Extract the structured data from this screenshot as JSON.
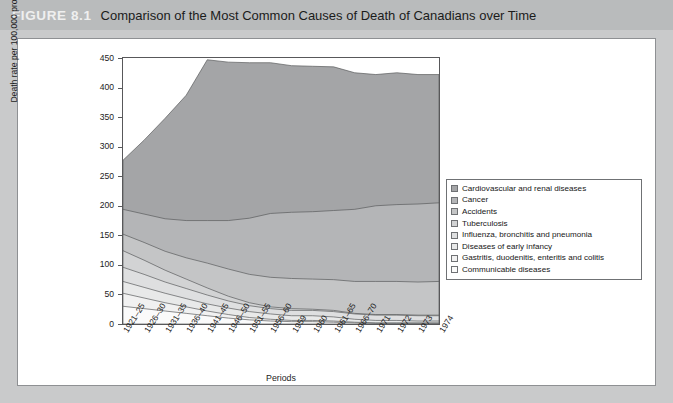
{
  "figure": {
    "number": "FIGURE 8.1",
    "title": "Comparison of the Most Common Causes of Death of Canadians over Time"
  },
  "colors": {
    "banner": "#b9bbbc",
    "page_background": "#c9cacb",
    "card": "#ffffff",
    "frame": "#58585a",
    "series": [
      "#a4a5a7",
      "#b4b5b7",
      "#c4c5c6",
      "#d2d3d4",
      "#dedfe0",
      "#e8e9e9",
      "#f1f1f1",
      "#fafafa"
    ]
  },
  "legend": {
    "items": [
      {
        "label": "Cardiovascular and renal diseases",
        "color": "#a4a5a7"
      },
      {
        "label": "Cancer",
        "color": "#b4b5b7"
      },
      {
        "label": "Accidents",
        "color": "#c4c5c6"
      },
      {
        "label": "Tuberculosis",
        "color": "#d2d3d4"
      },
      {
        "label": "Influenza, bronchitis and pneumonia",
        "color": "#dedfe0"
      },
      {
        "label": "Diseases of early infancy",
        "color": "#e8e9e9"
      },
      {
        "label": "Gastritis, duodenitis, enteritis and colitis",
        "color": "#f1f1f1"
      },
      {
        "label": "Communicable diseases",
        "color": "#fafafa"
      }
    ]
  },
  "chart_data": {
    "type": "area",
    "stacked": true,
    "title": "Comparison of the Most Common Causes of Death of Canadians over Time",
    "xlabel": "Periods",
    "ylabel": "Death rate per 100,000 prop'n by cause",
    "ylim": [
      0,
      450
    ],
    "ytick_step": 50,
    "yticks": [
      0,
      50,
      100,
      150,
      200,
      250,
      300,
      350,
      400,
      450
    ],
    "grid": false,
    "legend_position": "right",
    "categories": [
      "1921-25",
      "1926-30",
      "1931-35",
      "1936-40",
      "1941-45",
      "1946-50",
      "1951-55",
      "1956-60",
      "1959",
      "1960",
      "1961-65",
      "1966-70",
      "1971",
      "1972",
      "1973",
      "1974"
    ],
    "series": [
      {
        "name": "Cardiovascular and renal diseases",
        "color": "#a4a5a7",
        "values": [
          83,
          125,
          170,
          212,
          272,
          268,
          263,
          255,
          248,
          246,
          243,
          231,
          222,
          223,
          219,
          217
        ]
      },
      {
        "name": "Cancer",
        "color": "#b4b5b7",
        "values": [
          42,
          48,
          55,
          63,
          72,
          82,
          95,
          108,
          112,
          114,
          117,
          122,
          128,
          130,
          132,
          133
        ]
      },
      {
        "name": "Accidents",
        "color": "#c4c5c6",
        "values": [
          28,
          30,
          32,
          36,
          42,
          46,
          48,
          50,
          51,
          51,
          52,
          54,
          56,
          56,
          56,
          57
        ]
      },
      {
        "name": "Tuberculosis",
        "color": "#d2d3d4",
        "values": [
          28,
          24,
          20,
          16,
          12,
          8,
          5,
          3,
          3,
          2,
          2,
          1,
          1,
          1,
          1,
          1
        ]
      },
      {
        "name": "Influenza, bronchitis and pneumonia",
        "color": "#dedfe0",
        "values": [
          24,
          22,
          19,
          17,
          15,
          12,
          10,
          9,
          9,
          9,
          9,
          9,
          9,
          9,
          9,
          9
        ]
      },
      {
        "name": "Diseases of early infancy",
        "color": "#e8e9e9",
        "values": [
          20,
          18,
          16,
          14,
          12,
          11,
          10,
          9,
          8,
          8,
          7,
          5,
          4,
          4,
          3,
          3
        ]
      },
      {
        "name": "Gastritis, duodenitis, enteritis and colitis",
        "color": "#f1f1f1",
        "values": [
          22,
          18,
          14,
          11,
          8,
          6,
          4,
          3,
          2,
          2,
          2,
          1,
          1,
          1,
          1,
          1
        ]
      },
      {
        "name": "Communicable diseases",
        "color": "#fafafa",
        "values": [
          30,
          26,
          22,
          18,
          14,
          10,
          7,
          5,
          4,
          4,
          3,
          2,
          1,
          1,
          1,
          1
        ]
      }
    ],
    "totals": [
      277,
      311,
      348,
      387,
      447,
      443,
      442,
      442,
      437,
      436,
      435,
      425,
      422,
      425,
      422,
      421
    ]
  }
}
